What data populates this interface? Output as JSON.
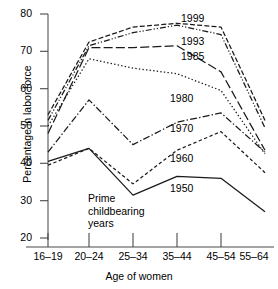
{
  "chart_data": {
    "type": "line",
    "title": "",
    "xlabel": "Age of women",
    "ylabel": "Percentage in labor force",
    "categories": [
      "16–19",
      "20–24",
      "25–34",
      "35–44",
      "45–54",
      "55–64"
    ],
    "ylim": [
      20,
      80
    ],
    "yticks": [
      20,
      30,
      40,
      50,
      60,
      70,
      80
    ],
    "ytick_labels": [
      "20",
      "30",
      "40",
      "50",
      "60",
      "70",
      "80"
    ],
    "grid": false,
    "legend_position": "inline-right-of-lines",
    "series": [
      {
        "name": "1999",
        "label": "1999",
        "style": "short-dash",
        "values": [
          53.0,
          72.5,
          76.5,
          77.5,
          76.5,
          51.5
        ]
      },
      {
        "name": "1993",
        "label": "1993",
        "style": "dash-dot-dot",
        "values": [
          51.5,
          71.5,
          75.0,
          77.0,
          74.5,
          49.5
        ]
      },
      {
        "name": "1985",
        "label": "1985",
        "style": "long-dash",
        "values": [
          48.0,
          71.0,
          71.0,
          71.5,
          64.5,
          43.5
        ]
      },
      {
        "name": "1980",
        "label": "1980",
        "style": "dotted",
        "values": [
          50.0,
          68.0,
          65.5,
          64.0,
          59.5,
          42.5
        ]
      },
      {
        "name": "1970",
        "label": "1970",
        "style": "dash-dot",
        "values": [
          43.0,
          57.0,
          45.0,
          51.0,
          53.5,
          43.0
        ]
      },
      {
        "name": "1960",
        "label": "1960",
        "style": "fine-dash",
        "values": [
          39.5,
          44.0,
          34.5,
          43.5,
          48.5,
          37.5
        ]
      },
      {
        "name": "1950",
        "label": "1950",
        "style": "solid",
        "values": [
          40.5,
          44.0,
          31.5,
          36.5,
          36.0,
          27.0
        ]
      }
    ],
    "annotations": [
      {
        "name": "prime-childbearing-years",
        "lines": [
          "Prime",
          "childbearing",
          "years"
        ],
        "x_category_range": [
          "20–24",
          "25–34"
        ]
      }
    ]
  },
  "axis": {
    "y_title": "Percentage in labor force",
    "x_title": "Age of women",
    "y_ticks": [
      "80",
      "70",
      "60",
      "50",
      "40",
      "30",
      "20"
    ],
    "x_ticks": [
      "16–19",
      "20–24",
      "25–34",
      "35–44",
      "45–54",
      "55–64"
    ]
  },
  "series_labels": {
    "s1999": "1999",
    "s1993": "1993",
    "s1985": "1985",
    "s1980": "1980",
    "s1970": "1970",
    "s1960": "1960",
    "s1950": "1950"
  },
  "annotation_text": {
    "line1": "Prime",
    "line2": "childbearing",
    "line3": "years"
  },
  "colors": {
    "line": "#1a1a1a",
    "axis": "#7a7a7a",
    "background": "#ffffff",
    "text": "#000000"
  }
}
